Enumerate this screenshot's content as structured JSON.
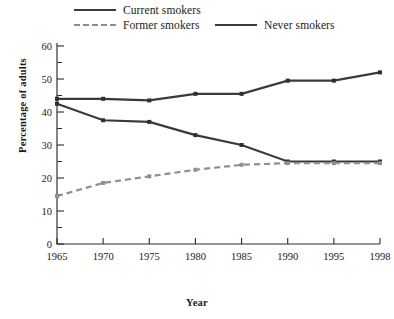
{
  "chart_data": {
    "type": "line",
    "title": "",
    "xlabel": "Year",
    "ylabel": "Percentage of adults",
    "x": [
      1965,
      1970,
      1975,
      1980,
      1985,
      1990,
      1995,
      1998
    ],
    "xticklabels": [
      "1965",
      "1970",
      "1975",
      "1980",
      "1985",
      "1990",
      "1995",
      "1998"
    ],
    "yticklabels": [
      "0",
      "10",
      "20",
      "30",
      "40",
      "50",
      "60"
    ],
    "ylim": [
      0,
      60
    ],
    "ytick_step": 10,
    "yminor_step": 5,
    "grid": false,
    "legend_position": "top",
    "series": [
      {
        "name": "Current smokers",
        "style": "solid",
        "color": "#3a3a3a",
        "values": [
          42.5,
          37.5,
          37.0,
          33.0,
          30.0,
          25.0,
          25.0,
          25.0
        ]
      },
      {
        "name": "Former smokers",
        "style": "dashed",
        "color": "#8f8f8f",
        "values": [
          14.5,
          18.5,
          20.5,
          22.5,
          24.0,
          24.5,
          24.5,
          24.5
        ]
      },
      {
        "name": "Never smokers",
        "style": "solid",
        "color": "#3a3a3a",
        "values": [
          44.0,
          44.0,
          43.5,
          45.5,
          45.5,
          49.5,
          49.5,
          52.0
        ]
      }
    ]
  },
  "legend": {
    "current": "Current smokers",
    "former": "Former smokers",
    "never": "Never smokers"
  },
  "axes": {
    "xlabel": "Year",
    "ylabel": "Percentage of adults"
  },
  "caption": ""
}
